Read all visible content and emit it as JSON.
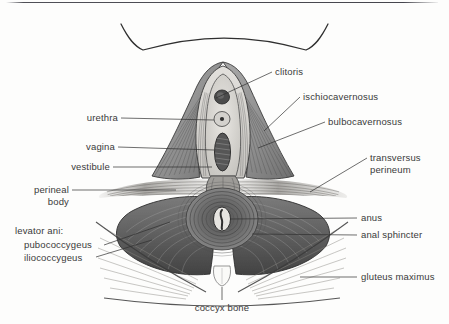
{
  "figure": {
    "background_color": "#fdfdfc",
    "ink_color": "#2f2f2f",
    "label_color": "#3a3a3a"
  },
  "labels": {
    "clitoris": "clitoris",
    "ischiocavernosus": "ischiocavernosus",
    "bulbocavernosus": "bulbocavernosus",
    "transversus": "transversus",
    "perineum": "perineum",
    "anus": "anus",
    "anal_sphincter": "anal sphincter",
    "gluteus_maximus": "gluteus maximus",
    "urethra": "urethra",
    "vagina": "vagina",
    "vestibule": "vestibule",
    "perineal": "perineal",
    "body": "body",
    "levator_ani": "levator ani:",
    "pubococcygeus": "pubococcygeus",
    "iliococcygeus": "iliococcygeus",
    "coccyx_bone": "coccyx bone"
  },
  "structures": [
    {
      "name": "pubic-arch-outline",
      "kind": "contour"
    },
    {
      "name": "clitoris",
      "kind": "organ"
    },
    {
      "name": "urethra",
      "kind": "orifice"
    },
    {
      "name": "vagina",
      "kind": "orifice"
    },
    {
      "name": "vestibule",
      "kind": "region"
    },
    {
      "name": "ischiocavernosus-muscle",
      "kind": "muscle"
    },
    {
      "name": "bulbocavernosus-muscle",
      "kind": "muscle"
    },
    {
      "name": "transversus-perineum-muscle",
      "kind": "muscle"
    },
    {
      "name": "perineal-body",
      "kind": "structure"
    },
    {
      "name": "anus",
      "kind": "orifice"
    },
    {
      "name": "anal-sphincter",
      "kind": "muscle"
    },
    {
      "name": "levator-ani-pubococcygeus",
      "kind": "muscle"
    },
    {
      "name": "levator-ani-iliococcygeus",
      "kind": "muscle"
    },
    {
      "name": "gluteus-maximus-muscle",
      "kind": "muscle"
    },
    {
      "name": "coccyx-bone",
      "kind": "bone"
    }
  ]
}
